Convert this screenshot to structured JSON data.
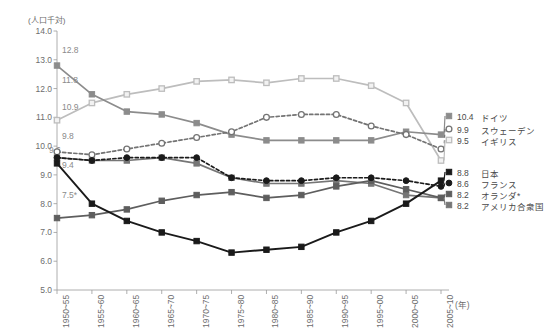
{
  "chart_data": {
    "type": "line",
    "title": "",
    "ylabel": "(人口千対)",
    "xlabel": "(年)",
    "ylim": [
      5.0,
      14.0
    ],
    "ytick_labels": [
      "14.0",
      "13.0",
      "12.0",
      "11.0",
      "10.0",
      "9.0",
      "8.0",
      "7.0",
      "6.0",
      "5.0"
    ],
    "ytick_values": [
      14.0,
      13.0,
      12.0,
      11.0,
      10.0,
      9.0,
      8.0,
      7.0,
      6.0,
      5.0
    ],
    "grid": false,
    "legend_position": "right",
    "categories": [
      "1950~55",
      "1955~60",
      "1960~65",
      "1965~70",
      "1970~75",
      "1975~80",
      "1980~85",
      "1985~90",
      "1990~95",
      "1995~00",
      "2000~05",
      "2005~10"
    ],
    "series": [
      {
        "name": "ドイツ",
        "start_label": "12.8",
        "end_label": "10.4",
        "marker": "square-filled-gray",
        "line": "solid",
        "color": "#8c8c8c",
        "values": [
          12.8,
          11.8,
          11.2,
          11.1,
          10.8,
          10.4,
          10.2,
          10.2,
          10.2,
          10.2,
          10.5,
          10.4
        ]
      },
      {
        "name": "スウェーデン",
        "start_label": "9.8",
        "end_label": "9.9",
        "marker": "circle-open",
        "line": "dashed",
        "color": "#737373",
        "values": [
          9.8,
          9.7,
          9.9,
          10.1,
          10.3,
          10.5,
          11.0,
          11.1,
          11.1,
          10.7,
          10.4,
          9.9
        ]
      },
      {
        "name": "イギリス",
        "start_label": "10.9",
        "end_label": "9.5",
        "marker": "square-open-light",
        "line": "solid",
        "color": "#bdbdbd",
        "values": [
          10.9,
          11.5,
          11.8,
          12.0,
          12.25,
          12.3,
          12.2,
          12.35,
          12.35,
          12.1,
          11.5,
          9.5
        ]
      },
      {
        "name": "日本",
        "start_label": "9.4",
        "end_label": "8.8",
        "marker": "square-filled-black",
        "line": "solid",
        "color": "#1a1a1a",
        "values": [
          9.4,
          8.0,
          7.4,
          7.0,
          6.7,
          6.3,
          6.4,
          6.5,
          7.0,
          7.4,
          8.0,
          8.8
        ]
      },
      {
        "name": "フランス",
        "start_label": "9.6",
        "end_label": "8.6",
        "marker": "circle-filled-black",
        "line": "dashed",
        "color": "#1a1a1a",
        "values": [
          9.6,
          9.5,
          9.6,
          9.6,
          9.6,
          8.9,
          8.8,
          8.8,
          8.9,
          8.9,
          8.8,
          8.6
        ]
      },
      {
        "name": "オランダ*",
        "start_label": "7.5*",
        "end_label": "8.2",
        "marker": "square-filled-darkgray",
        "line": "solid",
        "color": "#5e5e5e",
        "values": [
          7.5,
          7.6,
          7.8,
          8.1,
          8.3,
          8.4,
          8.2,
          8.3,
          8.6,
          8.8,
          8.5,
          8.2
        ]
      },
      {
        "name": "アメリカ合衆国",
        "start_label": "",
        "end_label": "8.2",
        "marker": "square-filled-gray2",
        "line": "solid",
        "color": "#767676",
        "values": [
          9.6,
          9.5,
          9.5,
          9.6,
          9.4,
          8.9,
          8.7,
          8.7,
          8.8,
          8.7,
          8.3,
          8.2
        ]
      }
    ],
    "start_labels": [
      {
        "text": "12.8",
        "x": 62,
        "y": 45
      },
      {
        "text": "11.8",
        "x": 62,
        "y": 75
      },
      {
        "text": "10.9",
        "x": 62,
        "y": 102
      },
      {
        "text": "9.8",
        "x": 62,
        "y": 131
      },
      {
        "text": "9.6",
        "x": 49,
        "y": 145
      },
      {
        "text": "9.4",
        "x": 62,
        "y": 160
      },
      {
        "text": "7.5*",
        "x": 62,
        "y": 190
      }
    ],
    "legend_entries": [
      {
        "value": "10.4",
        "name": "ドイツ",
        "marker": "square-filled-gray",
        "y": 116
      },
      {
        "value": "9.9",
        "name": "スウェーデン",
        "marker": "circle-open",
        "y": 129
      },
      {
        "value": "9.5",
        "name": "イギリス",
        "marker": "square-open-light",
        "y": 140
      },
      {
        "value": "8.8",
        "name": "日本",
        "marker": "square-filled-black",
        "y": 172
      },
      {
        "value": "8.6",
        "name": "フランス",
        "marker": "circle-filled-black",
        "y": 183
      },
      {
        "value": "8.2",
        "name": "オランダ*",
        "marker": "square-filled-darkgray",
        "y": 194
      },
      {
        "value": "8.2",
        "name": "アメリカ合衆国",
        "marker": "square-filled-gray2",
        "y": 205
      }
    ]
  }
}
